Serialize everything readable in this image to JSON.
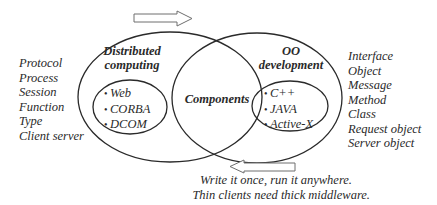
{
  "diagram": {
    "left_circle": {
      "title_line1": "Distributed",
      "title_line2": "computing",
      "items": [
        "Web",
        "CORBA",
        "DCOM"
      ]
    },
    "right_circle": {
      "title_line1": "OO",
      "title_line2": "development",
      "items": [
        "C++",
        "JAVA",
        "Active-X"
      ]
    },
    "intersection": {
      "label": "Components"
    },
    "left_terms": [
      "Protocol",
      "Process",
      "Session",
      "Function",
      "Type",
      "Client server"
    ],
    "right_terms": [
      "Interface",
      "Object",
      "Message",
      "Method",
      "Class",
      "Request object",
      "Server object"
    ],
    "arrows": {
      "top_direction": "right",
      "bottom_direction": "left"
    },
    "slogans": [
      "Write it once, run it anywhere.",
      "Thin clients need thick middleware."
    ],
    "colors": {
      "stroke": "#2a2a2a",
      "arrow_stroke": "#6e6e6e",
      "text": "#2a2a2a"
    }
  }
}
